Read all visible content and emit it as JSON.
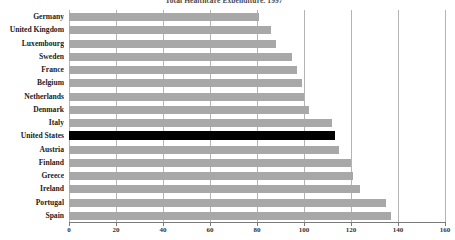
{
  "chart_data": {
    "type": "bar",
    "orientation": "horizontal",
    "title": "Total Healthcare Expenditure, 1997",
    "xlabel": "",
    "ylabel": "",
    "xlim": [
      0,
      160
    ],
    "grid": true,
    "legend": "none",
    "tick_labels": [
      "0",
      "20",
      "40",
      "60",
      "80",
      "100",
      "120",
      "140",
      "160"
    ],
    "ticks": [
      0,
      20,
      40,
      60,
      80,
      100,
      120,
      140,
      160
    ],
    "categories": [
      "Germany",
      "United Kingdom",
      "Luxembourg",
      "Sweden",
      "France",
      "Belgium",
      "Netherlands",
      "Denmark",
      "Italy",
      "United States",
      "Austria",
      "Finland",
      "Greece",
      "Ireland",
      "Portugal",
      "Spain"
    ],
    "values": [
      81,
      86,
      88,
      95,
      97,
      99,
      100,
      102,
      112,
      113,
      115,
      120,
      121,
      124,
      135,
      137
    ],
    "highlight_category": "United States",
    "colors": {
      "bar": "#a8a8a8",
      "bar_highlight": "#000000",
      "gridline": "#b4b4b4",
      "axis": "#7a7a7a",
      "label_text": "#1a1a1a",
      "tick_text": "#333333",
      "title_text": "#4a4a4a",
      "background": "#ffffff"
    }
  }
}
